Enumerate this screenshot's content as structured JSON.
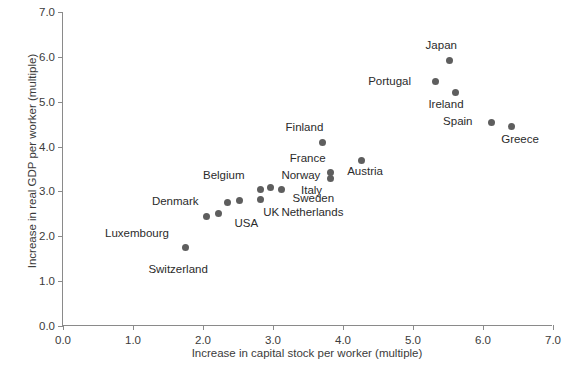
{
  "chart_data": {
    "type": "scatter",
    "title": "",
    "xlabel": "Increase in capital stock per worker (multiple)",
    "ylabel": "Increase in real GDP per worker (multiple)",
    "xlim": [
      0.0,
      7.0
    ],
    "ylim": [
      0.0,
      7.0
    ],
    "xticks": [
      "0.0",
      "1.0",
      "2.0",
      "3.0",
      "4.0",
      "5.0",
      "6.0",
      "7.0"
    ],
    "yticks": [
      "0.0",
      "1.0",
      "2.0",
      "3.0",
      "4.0",
      "5.0",
      "6.0",
      "7.0"
    ],
    "grid": false,
    "legend": false,
    "marker_color": "#5e5e5e",
    "axis_color": "#8a8a8a",
    "points": [
      {
        "label": "Switzerland",
        "x": 1.75,
        "y": 1.75,
        "lx": 1.22,
        "ly": 1.25
      },
      {
        "label": "Luxembourg",
        "x": 2.05,
        "y": 2.45,
        "lx": 0.6,
        "ly": 2.05
      },
      {
        "label": "Denmark",
        "x": 2.35,
        "y": 2.75,
        "lx": 1.27,
        "ly": 2.76
      },
      {
        "label": "USA",
        "x": 2.22,
        "y": 2.5,
        "lx": 2.45,
        "ly": 2.27
      },
      {
        "label": "UK",
        "x": 2.52,
        "y": 2.8,
        "lx": 2.86,
        "ly": 2.52
      },
      {
        "label": "Netherlands",
        "x": 2.82,
        "y": 2.83,
        "lx": 3.12,
        "ly": 2.52
      },
      {
        "label": "Belgium",
        "x": 2.82,
        "y": 3.05,
        "lx": 2.0,
        "ly": 3.34
      },
      {
        "label": "Sweden",
        "x": 2.96,
        "y": 3.08,
        "lx": 3.28,
        "ly": 2.84
      },
      {
        "label": "Norway",
        "x": 3.12,
        "y": 3.05,
        "lx": 3.12,
        "ly": 3.34
      },
      {
        "label": "Finland",
        "x": 3.7,
        "y": 4.1,
        "lx": 3.18,
        "ly": 4.42
      },
      {
        "label": "France",
        "x": 3.82,
        "y": 3.42,
        "lx": 3.24,
        "ly": 3.72
      },
      {
        "label": "Italy",
        "x": 3.82,
        "y": 3.28,
        "lx": 3.4,
        "ly": 3.02
      },
      {
        "label": "Austria",
        "x": 4.26,
        "y": 3.7,
        "lx": 4.06,
        "ly": 3.43
      },
      {
        "label": "Portugal",
        "x": 5.32,
        "y": 5.45,
        "lx": 4.36,
        "ly": 5.45
      },
      {
        "label": "Japan",
        "x": 5.52,
        "y": 5.92,
        "lx": 5.18,
        "ly": 6.25
      },
      {
        "label": "Ireland",
        "x": 5.6,
        "y": 5.2,
        "lx": 5.22,
        "ly": 4.92
      },
      {
        "label": "Spain",
        "x": 6.12,
        "y": 4.54,
        "lx": 5.43,
        "ly": 4.54
      },
      {
        "label": "Greece",
        "x": 6.4,
        "y": 4.45,
        "lx": 6.26,
        "ly": 4.15
      }
    ]
  }
}
